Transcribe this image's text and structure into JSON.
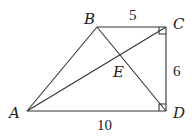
{
  "diagram": {
    "type": "geometry",
    "points": {
      "A": {
        "label": "A",
        "x": 27,
        "y": 111
      },
      "B": {
        "label": "B",
        "x": 97,
        "y": 27
      },
      "C": {
        "label": "C",
        "x": 166,
        "y": 27
      },
      "D": {
        "label": "D",
        "x": 166,
        "y": 111
      },
      "E": {
        "label": "E"
      }
    },
    "segments": [
      "AB",
      "BC",
      "CD",
      "DA",
      "AC",
      "BD"
    ],
    "right_angles": [
      "C",
      "D"
    ],
    "lengths": {
      "BC": "5",
      "CD": "6",
      "AD": "10"
    }
  }
}
